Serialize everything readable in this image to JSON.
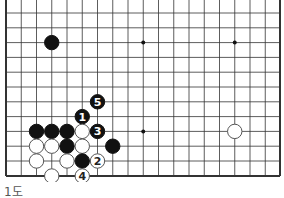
{
  "diagram": {
    "caption": "1도",
    "grid": {
      "origin_x": 6,
      "origin_y": 13,
      "dx": 15.25,
      "dy": 14.8,
      "cols": 18,
      "rows": 11,
      "right_edge_x": 280,
      "bottom_edge_y": 176,
      "has_left_edge": true,
      "has_right_edge": true,
      "has_bottom_edge": true
    },
    "hoshi": [
      [
        9,
        2
      ],
      [
        15,
        2
      ],
      [
        9,
        8
      ]
    ],
    "stones": [
      {
        "c": 3,
        "r": 2,
        "color": "black",
        "label": ""
      },
      {
        "c": 6,
        "r": 6,
        "color": "black",
        "label": "5"
      },
      {
        "c": 5,
        "r": 7,
        "color": "black",
        "label": "1"
      },
      {
        "c": 2,
        "r": 8,
        "color": "black",
        "label": ""
      },
      {
        "c": 3,
        "r": 8,
        "color": "black",
        "label": ""
      },
      {
        "c": 4,
        "r": 8,
        "color": "black",
        "label": ""
      },
      {
        "c": 5,
        "r": 8,
        "color": "white",
        "label": ""
      },
      {
        "c": 6,
        "r": 8,
        "color": "black",
        "label": "3"
      },
      {
        "c": 15,
        "r": 8,
        "color": "white",
        "label": ""
      },
      {
        "c": 2,
        "r": 9,
        "color": "white",
        "label": ""
      },
      {
        "c": 3,
        "r": 9,
        "color": "white",
        "label": ""
      },
      {
        "c": 4,
        "r": 9,
        "color": "black",
        "label": ""
      },
      {
        "c": 5,
        "r": 9,
        "color": "white",
        "label": ""
      },
      {
        "c": 7,
        "r": 9,
        "color": "black",
        "label": ""
      },
      {
        "c": 2,
        "r": 10,
        "color": "white",
        "label": ""
      },
      {
        "c": 4,
        "r": 10,
        "color": "white",
        "label": ""
      },
      {
        "c": 5,
        "r": 10,
        "color": "black",
        "label": ""
      },
      {
        "c": 6,
        "r": 10,
        "color": "white",
        "label": "2"
      },
      {
        "c": 3,
        "r": 11,
        "color": "white",
        "label": ""
      },
      {
        "c": 5,
        "r": 11,
        "color": "white",
        "label": "4"
      }
    ]
  }
}
